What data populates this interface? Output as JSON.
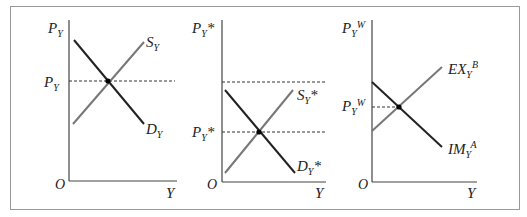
{
  "figure": {
    "panels": [
      {
        "id": "home",
        "y_axis_label": "P_Y",
        "x_axis_label": "Y",
        "origin_label": "O",
        "price_label": "P_Y",
        "supply_label": "S_Y",
        "demand_label": "D_Y"
      },
      {
        "id": "foreign",
        "y_axis_label": "P_Y*",
        "x_axis_label": "Y",
        "origin_label": "O",
        "price_label": "P_Y*",
        "supply_label": "S_Y*",
        "demand_label": "D_Y*"
      },
      {
        "id": "world",
        "y_axis_label": "P_Y^W",
        "x_axis_label": "Y",
        "origin_label": "O",
        "price_label": "P_Y^W",
        "export_supply_label": "EX_Y^B",
        "import_demand_label": "IM_Y^A"
      }
    ],
    "colors": {
      "demand": "#222222",
      "supply": "#777777",
      "axis": "#444444",
      "frame": "#999999"
    }
  },
  "labels": {
    "P": "P",
    "Y_sub": "Y",
    "star": "*",
    "W": "W",
    "S": "S",
    "D": "D",
    "EX": "EX",
    "IM": "IM",
    "A": "A",
    "B": "B",
    "O": "O",
    "Y": "Y"
  }
}
